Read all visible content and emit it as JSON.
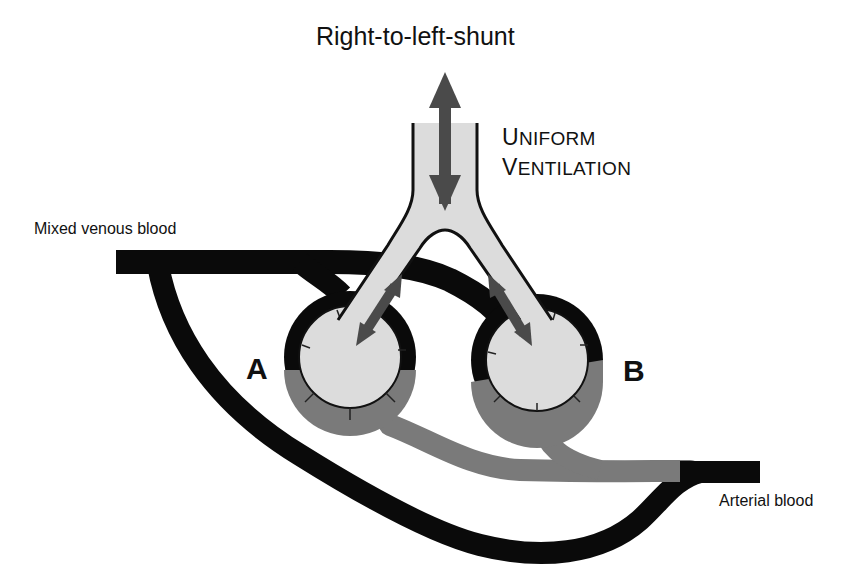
{
  "diagram": {
    "title": "Right-to-left-shunt",
    "ventilation_label": {
      "line1": {
        "initial": "U",
        "rest": "NIFORM"
      },
      "line2": {
        "initial": "V",
        "rest": "ENTILATION"
      },
      "full_text": "Uniform Ventilation"
    },
    "labels": {
      "inflow": "Mixed venous blood",
      "outflow": "Arterial blood",
      "alveolus_a": "A",
      "alveolus_b": "B"
    },
    "colors": {
      "background": "#ffffff",
      "venous_blood": "#0a0a0a",
      "arterial_blood": "#7a7a7a",
      "airway_fill": "#dcdcdc",
      "arrow": "#4a4a4a",
      "outline": "#111111"
    },
    "elements": [
      {
        "id": "airway",
        "description": "Trachea splitting into two bronchi leading to alveoli A and B"
      },
      {
        "id": "alveolus-a",
        "description": "Alveolus A, upper capillary dark (venous), lower capillary gray (arterialized)"
      },
      {
        "id": "alveolus-b",
        "description": "Alveolus B, upper capillary dark (venous), lower capillary gray (arterialized)"
      },
      {
        "id": "shunt-vessel",
        "description": "Black vessel bypassing alveoli from mixed venous to arterial side"
      },
      {
        "id": "ventilation-arrows",
        "description": "Double-headed arrows in trachea and both bronchi indicating uniform ventilation"
      }
    ]
  }
}
